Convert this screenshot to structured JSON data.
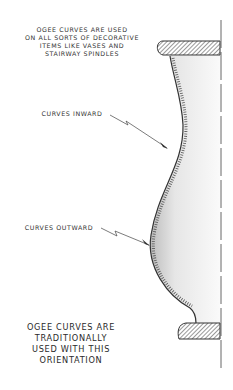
{
  "diagram": {
    "title_note": {
      "lines": [
        "OGEE CURVES ARE USED",
        "ON ALL SORTS OF DECORATIVE",
        "ITEMS LIKE VASES AND",
        "STAIRWAY SPINDLES"
      ]
    },
    "callouts": [
      {
        "label": "CURVES INWARD"
      },
      {
        "label": "CURVES OUTWARD"
      }
    ],
    "footer_note": {
      "lines": [
        "OGEE CURVES ARE",
        "TRADITIONALLY",
        "USED WITH THIS",
        "ORIENTATION"
      ]
    },
    "colors": {
      "ink": "#333333",
      "shade": "#d9d9d9",
      "background": "#ffffff"
    }
  }
}
